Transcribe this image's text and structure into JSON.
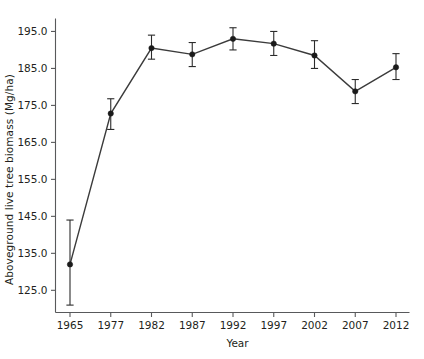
{
  "chart_data": {
    "type": "line",
    "title": "",
    "xlabel": "Year",
    "ylabel": "Aboveground live tree biomass (Mg/ha)",
    "categories": [
      "1965",
      "1977",
      "1982",
      "1987",
      "1992",
      "1997",
      "2002",
      "2007",
      "2012"
    ],
    "values": [
      132.0,
      172.8,
      190.5,
      188.8,
      193.0,
      191.7,
      188.5,
      178.8,
      185.3
    ],
    "error_upper": [
      144.0,
      176.8,
      194.0,
      192.0,
      196.0,
      195.0,
      192.5,
      182.0,
      189.0
    ],
    "error_lower": [
      121.0,
      168.5,
      187.5,
      185.5,
      190.0,
      188.5,
      185.0,
      175.5,
      182.0
    ],
    "ylim": [
      119.0,
      198.5
    ],
    "ytick_labels": [
      "125.0",
      "135.0",
      "145.0",
      "155.0",
      "165.0",
      "175.0",
      "185.0",
      "195.0"
    ],
    "ytick_values": [
      125.0,
      135.0,
      145.0,
      155.0,
      165.0,
      175.0,
      185.0,
      195.0
    ],
    "xtick_labels": [
      "1965",
      "1977",
      "1982",
      "1987",
      "1992",
      "1997",
      "2002",
      "2007",
      "2012"
    ],
    "grid": false,
    "legend": null,
    "marker": "filled-circle",
    "line_color": "#3b3b3b",
    "marker_color": "#1a1a1a",
    "axis_color": "#58595b",
    "background_color": "#ffffff"
  }
}
